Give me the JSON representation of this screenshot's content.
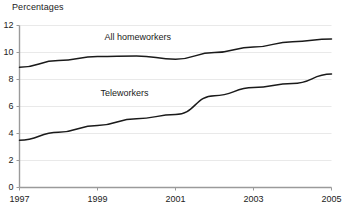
{
  "chart_data": {
    "type": "line",
    "title": "Percentages",
    "xlabel": "",
    "ylabel": "Percentages",
    "xlim": [
      1997,
      2005
    ],
    "ylim": [
      0,
      12
    ],
    "grid": true,
    "legend_position": "inline-annotations",
    "x": [
      1997,
      1998,
      1999,
      2000,
      2001,
      2002,
      2003,
      2004,
      2005
    ],
    "ytick_labels": [
      "0",
      "2",
      "4",
      "6",
      "8",
      "10",
      "12"
    ],
    "ytick_values": [
      0,
      2,
      4,
      6,
      8,
      10,
      12
    ],
    "xtick_labels": [
      "1997",
      "1999",
      "2001",
      "2003",
      "2005"
    ],
    "xtick_values": [
      1997,
      1999,
      2001,
      2003,
      2005
    ],
    "series": [
      {
        "name": "All homeworkers",
        "color": "#1a1a1a",
        "values": [
          8.9,
          9.4,
          9.7,
          9.75,
          9.5,
          10.0,
          10.4,
          10.8,
          11.0
        ],
        "label_x": 2000.1,
        "label_y": 11.1
      },
      {
        "name": "Teleworkers",
        "color": "#1a1a1a",
        "values": [
          3.5,
          4.1,
          4.6,
          5.1,
          5.4,
          6.8,
          7.4,
          7.7,
          8.4
        ],
        "label_x": 2000.0,
        "label_y": 6.9
      }
    ],
    "colors": {
      "gridline": "#e9e9e9",
      "axis": "#9a9a9a",
      "text": "#222222",
      "line": "#1a1a1a",
      "background": "#ffffff"
    }
  }
}
